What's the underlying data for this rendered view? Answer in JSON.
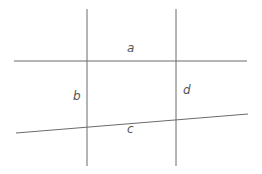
{
  "diagram": {
    "line_color": "#6b6b6b",
    "label_color": "#555555",
    "lines": {
      "top": {
        "x1": 14,
        "y1": 61,
        "x2": 247,
        "y2": 61
      },
      "bottom": {
        "x1": 16,
        "y1": 133,
        "x2": 248,
        "y2": 114
      },
      "left": {
        "x1": 87,
        "y1": 9,
        "x2": 87,
        "y2": 166
      },
      "right": {
        "x1": 176,
        "y1": 9,
        "x2": 176,
        "y2": 166
      }
    },
    "labels": {
      "a": {
        "text": "a",
        "x": 127,
        "y": 52
      },
      "b": {
        "text": "b",
        "x": 73,
        "y": 100
      },
      "c": {
        "text": "c",
        "x": 127,
        "y": 133
      },
      "d": {
        "text": "d",
        "x": 183,
        "y": 94
      }
    }
  }
}
